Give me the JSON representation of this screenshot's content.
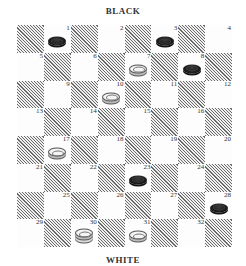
{
  "labels": {
    "top": "BLACK",
    "bottom": "WHITE"
  },
  "board": {
    "rows": 8,
    "cols": 8,
    "squares": [
      {
        "num": "1",
        "row": 0,
        "col": 1,
        "piece": "black"
      },
      {
        "num": "2",
        "row": 0,
        "col": 3,
        "piece": null
      },
      {
        "num": "3",
        "row": 0,
        "col": 5,
        "piece": "black"
      },
      {
        "num": "4",
        "row": 0,
        "col": 7,
        "piece": null
      },
      {
        "num": "5",
        "row": 1,
        "col": 0,
        "piece": null
      },
      {
        "num": "6",
        "row": 1,
        "col": 2,
        "piece": null
      },
      {
        "num": "7",
        "row": 1,
        "col": 4,
        "piece": "white"
      },
      {
        "num": "8",
        "row": 1,
        "col": 6,
        "piece": "black"
      },
      {
        "num": "9",
        "row": 2,
        "col": 1,
        "piece": null
      },
      {
        "num": "10",
        "row": 2,
        "col": 3,
        "piece": "white"
      },
      {
        "num": "11",
        "row": 2,
        "col": 5,
        "piece": null
      },
      {
        "num": "12",
        "row": 2,
        "col": 7,
        "piece": null
      },
      {
        "num": "13",
        "row": 3,
        "col": 0,
        "piece": null
      },
      {
        "num": "14",
        "row": 3,
        "col": 2,
        "piece": null
      },
      {
        "num": "15",
        "row": 3,
        "col": 4,
        "piece": null
      },
      {
        "num": "16",
        "row": 3,
        "col": 6,
        "piece": null
      },
      {
        "num": "17",
        "row": 4,
        "col": 1,
        "piece": "white"
      },
      {
        "num": "18",
        "row": 4,
        "col": 3,
        "piece": null
      },
      {
        "num": "19",
        "row": 4,
        "col": 5,
        "piece": null
      },
      {
        "num": "20",
        "row": 4,
        "col": 7,
        "piece": null
      },
      {
        "num": "21",
        "row": 5,
        "col": 0,
        "piece": null
      },
      {
        "num": "22",
        "row": 5,
        "col": 2,
        "piece": null
      },
      {
        "num": "23",
        "row": 5,
        "col": 4,
        "piece": "black"
      },
      {
        "num": "24",
        "row": 5,
        "col": 6,
        "piece": null
      },
      {
        "num": "25",
        "row": 6,
        "col": 1,
        "piece": null
      },
      {
        "num": "26",
        "row": 6,
        "col": 3,
        "piece": null
      },
      {
        "num": "27",
        "row": 6,
        "col": 5,
        "piece": null
      },
      {
        "num": "28",
        "row": 6,
        "col": 7,
        "piece": "black"
      },
      {
        "num": "29",
        "row": 7,
        "col": 0,
        "piece": null
      },
      {
        "num": "30",
        "row": 7,
        "col": 2,
        "piece": "white-king"
      },
      {
        "num": "31",
        "row": 7,
        "col": 4,
        "piece": "white"
      },
      {
        "num": "32",
        "row": 7,
        "col": 6,
        "piece": null
      }
    ]
  },
  "colors": {
    "black_piece": "#1a1a1a",
    "white_piece": "#f4f4f4",
    "hatch": "#6a6a6a"
  }
}
